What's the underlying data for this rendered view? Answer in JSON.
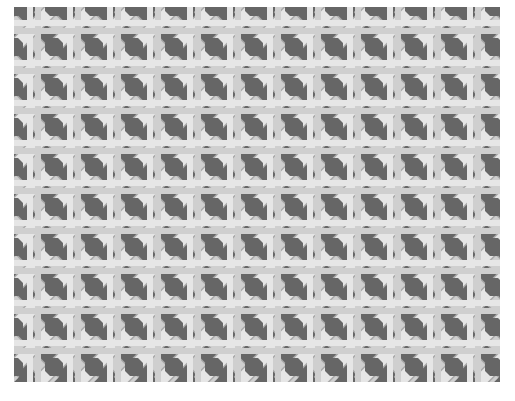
{
  "image": {
    "subject": "Woven cane webbing (rattan chair cane, octagonal weave)",
    "description": "Grayscale photograph of pale cane strands woven in horizontal, vertical and two diagonal directions, leaving dark octagonal openings.",
    "colors": {
      "background": "#ffffff",
      "hole": "#666666",
      "cane_light": "#e6e6e6",
      "cane_mid": "#cfcfcf",
      "cane_shadow": "#a8a8a8"
    }
  }
}
